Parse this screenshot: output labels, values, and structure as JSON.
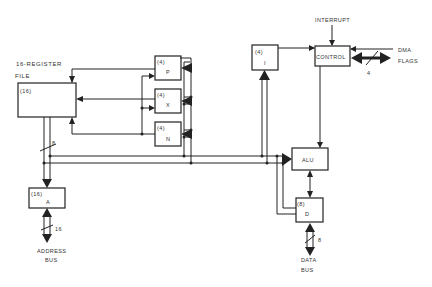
{
  "diagram": {
    "title_line1": "16-REGISTER",
    "title_line2": "FILE",
    "blocks": {
      "register_file": {
        "width_label": "(16)",
        "name": ""
      },
      "p": {
        "width_label": "(4)",
        "name": "P"
      },
      "x": {
        "width_label": "(4)",
        "name": "X"
      },
      "n": {
        "width_label": "(4)",
        "name": "N"
      },
      "i": {
        "width_label": "(4)",
        "name": "I"
      },
      "control": {
        "name": "CONTROL"
      },
      "alu": {
        "name": "ALU"
      },
      "d": {
        "width_label": "(8)",
        "name": "D"
      },
      "a": {
        "width_label": "(16)",
        "name": "A"
      }
    },
    "signals": {
      "interrupt": "INTERRUPT",
      "dma": "DMA",
      "flags": "FLAGS",
      "flags_width": "4",
      "regfile_bus_width": "8",
      "address_bus_width": "16",
      "data_bus_width": "8"
    },
    "bus_labels": {
      "address_line1": "ADDRESS",
      "address_line2": "BUS",
      "data_line1": "DATA",
      "data_line2": "BUS"
    },
    "colors": {
      "line": "#222222",
      "background": "#ffffff",
      "text": "#333333"
    }
  }
}
